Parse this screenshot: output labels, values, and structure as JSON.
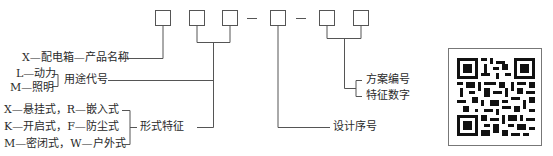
{
  "diagram": {
    "type": "model-code-structure",
    "code_pattern": [
      "□",
      "□",
      "□",
      "—",
      "□",
      "—",
      "□",
      "□"
    ],
    "labels": {
      "product_name": "X—配电箱—产品名称",
      "usage_option_1": "L—动力",
      "usage_option_2": "M—照明",
      "usage_code": "用途代号",
      "form_option_1": "X—悬挂式，R—嵌入式",
      "form_option_2": "K—开启式，F—防尘式",
      "form_option_3": "M—密闭式，W—户外式",
      "form_feature": "形式特征",
      "design_serial": "设计序号",
      "scheme_number": "方案编号",
      "feature_digit": "特征数字"
    },
    "qr_code": "qr-code-image"
  },
  "colors": {
    "line": "#555555",
    "text": "#2a2a2a",
    "background": "#ffffff"
  }
}
